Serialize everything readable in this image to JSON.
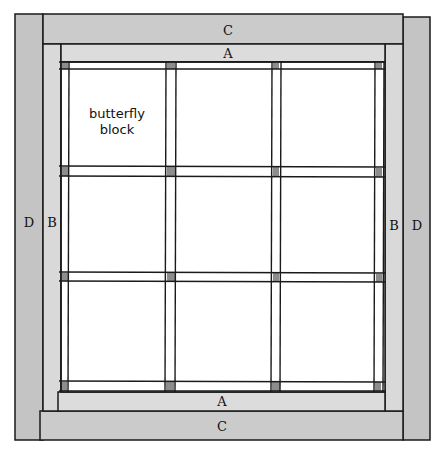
{
  "diagram": {
    "type": "quilt-layout",
    "colors": {
      "border_dark": "#c4c4c4",
      "border_light": "#d9d9d9",
      "block": "#ffffff",
      "line": "#1a1a1a"
    },
    "labels": {
      "top_outer": "C",
      "top_inner": "A",
      "bottom_inner": "A",
      "bottom_outer": "C",
      "left_outer": "D",
      "left_inner": "B",
      "right_inner": "B",
      "right_outer": "D"
    },
    "block_label": {
      "line1": "butterfly",
      "line2": "block"
    },
    "grid": {
      "rows": 3,
      "cols": 3
    }
  }
}
